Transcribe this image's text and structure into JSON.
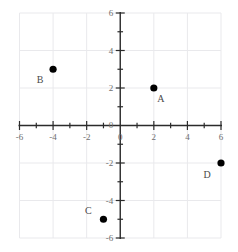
{
  "chart_data": {
    "type": "scatter",
    "title": "",
    "xlabel": "",
    "ylabel": "",
    "xlim": [
      -6,
      6
    ],
    "ylim": [
      -6,
      6
    ],
    "grid": true,
    "grid_step": 2,
    "tick_step": 1,
    "legend": "none",
    "x_tick_labels": [
      "-6",
      "-4",
      "-2",
      "0",
      "2",
      "4",
      "6"
    ],
    "x_tick_values": [
      -6,
      -4,
      -2,
      0,
      2,
      4,
      6
    ],
    "y_tick_labels": [
      "6",
      "4",
      "2",
      "0",
      "-2",
      "-4",
      "-6"
    ],
    "y_tick_values": [
      6,
      4,
      2,
      0,
      -2,
      -4,
      -6
    ],
    "points": [
      {
        "label": "A",
        "x": 2,
        "y": 2,
        "label_dx": 7,
        "label_dy": 14
      },
      {
        "label": "B",
        "x": -4,
        "y": 3,
        "label_dx": -13,
        "label_dy": 14
      },
      {
        "label": "C",
        "x": -1,
        "y": -5,
        "label_dx": -15,
        "label_dy": -5
      },
      {
        "label": "D",
        "x": 6,
        "y": -2,
        "label_dx": -14,
        "label_dy": 15
      }
    ],
    "point_color": "#000000",
    "point_radius": 3.6,
    "axis_color": "#2b2b2b",
    "grid_color": "#e9e9ec",
    "tick_label_color": "#6e6e6e"
  }
}
